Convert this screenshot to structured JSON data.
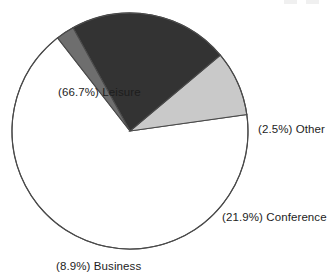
{
  "chart_data": {
    "type": "pie",
    "title": "",
    "subtitle": "",
    "xlabel": "",
    "ylabel": "",
    "legend_position": "none",
    "grid": false,
    "labels_show_percent": true,
    "start_angle_deg": -8,
    "direction": "clockwise",
    "categories": [
      "Leisure",
      "Other",
      "Conference",
      "Business"
    ],
    "values": [
      66.7,
      2.5,
      21.9,
      8.9
    ],
    "slices": [
      {
        "name": "Leisure",
        "percent": 66.7,
        "label": "(66.7%) Leisure",
        "color": "#ffffff",
        "edge_color": "#4a4a4a",
        "label_position": "inside-upper-left"
      },
      {
        "name": "Other",
        "percent": 2.5,
        "label": "(2.5%) Other",
        "color": "#6e6e6e",
        "edge_color": "#4a4a4a",
        "label_position": "outside-right"
      },
      {
        "name": "Conference",
        "percent": 21.9,
        "label": "(21.9%) Conference",
        "color": "#333333",
        "edge_color": "#4a4a4a",
        "label_position": "outside-lower-right"
      },
      {
        "name": "Business",
        "percent": 8.9,
        "label": "(8.9%) Business",
        "color": "#c9c9c9",
        "edge_color": "#4a4a4a",
        "label_position": "outside-bottom-left"
      }
    ],
    "geometry": {
      "center_x": 130,
      "center_y": 131,
      "radius": 118
    }
  },
  "labels": {
    "leisure": "(66.7%) Leisure",
    "other": "(2.5%) Other",
    "conference": "(21.9%) Conference",
    "business": "(8.9%) Business"
  },
  "colors": {
    "background": "#ffffff",
    "outline": "#4a4a4a",
    "text": "#1d1d1d",
    "slice_leisure": "#ffffff",
    "slice_other": "#6e6e6e",
    "slice_conference": "#333333",
    "slice_business": "#c9c9c9"
  }
}
